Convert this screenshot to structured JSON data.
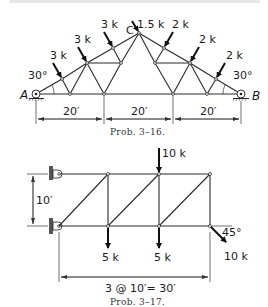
{
  "header_fragment": "...",
  "problem_3_16": {
    "caption": "Prob. 3–16.",
    "support_left": "A",
    "support_right": "B",
    "apex_label": "C",
    "angle_left": "30°",
    "angle_right": "30°",
    "loads": [
      {
        "label": "3 k",
        "side": "left"
      },
      {
        "label": "3 k",
        "side": "left"
      },
      {
        "label": "3 k",
        "side": "left"
      },
      {
        "label": "1.5 k",
        "side": "apex"
      },
      {
        "label": "2 k",
        "side": "right"
      },
      {
        "label": "2 k",
        "side": "right"
      },
      {
        "label": "2 k",
        "side": "right"
      }
    ],
    "spans": [
      "20′",
      "20′",
      "20′"
    ]
  },
  "problem_3_17": {
    "caption": "Prob. 3–17.",
    "height_dim": "10′",
    "span_dim": "3 @ 10′= 30′",
    "loads": [
      {
        "label": "10 k",
        "direction": "down",
        "node": "top-2"
      },
      {
        "label": "5 k",
        "direction": "down",
        "node": "bottom-1"
      },
      {
        "label": "5 k",
        "direction": "down",
        "node": "bottom-2"
      },
      {
        "label": "10 k",
        "direction": "45° down-right",
        "node": "bottom-3"
      }
    ],
    "angle_label": "45°"
  },
  "colors": {
    "ink": "#1a1a1a",
    "background": "#ffffff"
  }
}
